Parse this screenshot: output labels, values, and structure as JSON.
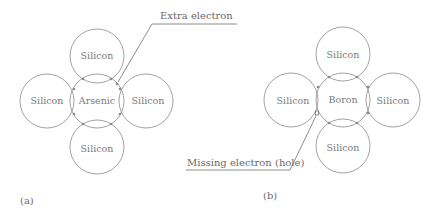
{
  "diagram": {
    "colors": {
      "stroke": "#8a8a8a",
      "text": "#7a7a7a",
      "background": "#ffffff"
    },
    "panels": [
      {
        "label": "(a)",
        "center_atom": "Arsenic",
        "neighbors": {
          "top": "Silicon",
          "left": "Silicon",
          "right": "Silicon",
          "bottom": "Silicon"
        },
        "callout": "Extra electron"
      },
      {
        "label": "(b)",
        "center_atom": "Boron",
        "neighbors": {
          "top": "Silicon",
          "left": "Silicon",
          "right": "Silicon",
          "bottom": "Silicon"
        },
        "callout": "Missing electron (hole)"
      }
    ]
  }
}
